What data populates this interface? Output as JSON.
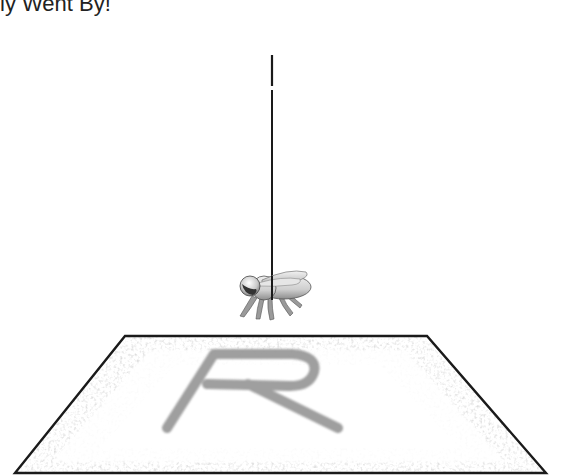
{
  "title": "ly Went By!",
  "scene": {
    "platform_letter": "R",
    "colors": {
      "outline": "#1a1a1a",
      "letter": "#9a9a9a",
      "speckle": "#b8b8b8",
      "fly_body": "#d9d9d9",
      "fly_shade": "#8a8a8a",
      "fly_dark": "#333333"
    }
  }
}
